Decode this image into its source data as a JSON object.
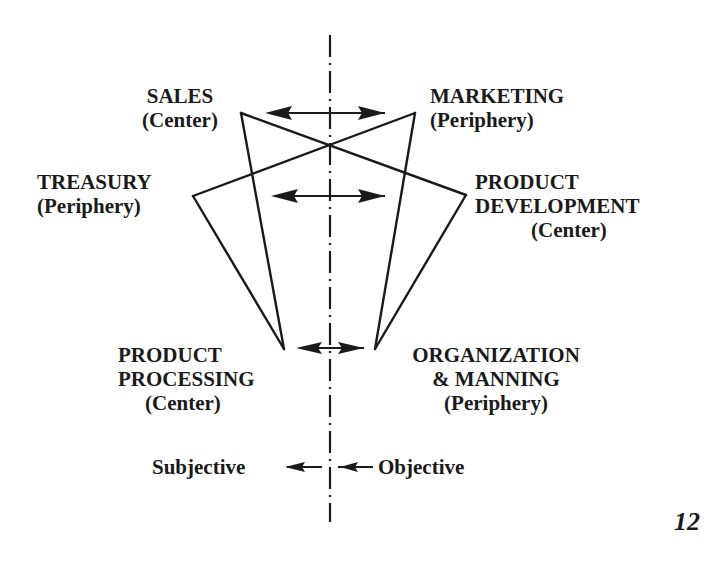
{
  "diagram": {
    "nodes": {
      "sales": {
        "name": "SALES",
        "role": "(Center)"
      },
      "marketing": {
        "name": "MARKETING",
        "role": "(Periphery)"
      },
      "treasury": {
        "name": "TREASURY",
        "role": "(Periphery)"
      },
      "product_development": {
        "line1": "PRODUCT",
        "line2": "DEVELOPMENT",
        "role": "(Center)"
      },
      "product_processing": {
        "line1": "PRODUCT",
        "line2": "PROCESSING",
        "role": "(Center)"
      },
      "organization_manning": {
        "line1": "ORGANIZATION",
        "line2": "& MANNING",
        "role": "(Periphery)"
      }
    },
    "edges": [
      [
        "sales",
        "product_processing"
      ],
      [
        "treasury",
        "product_processing"
      ],
      [
        "treasury",
        "marketing"
      ],
      [
        "sales",
        "product_development"
      ],
      [
        "product_development",
        "organization_manning"
      ],
      [
        "marketing",
        "organization_manning"
      ]
    ],
    "pairs": [
      [
        "sales",
        "marketing"
      ],
      [
        "treasury",
        "product_development"
      ],
      [
        "product_processing",
        "organization_manning"
      ]
    ],
    "axis": {
      "left_label": "Subjective",
      "right_label": "Objective"
    },
    "colors": {
      "ink": "#1a1a1a",
      "background": "#ffffff"
    }
  },
  "page_number": "12"
}
